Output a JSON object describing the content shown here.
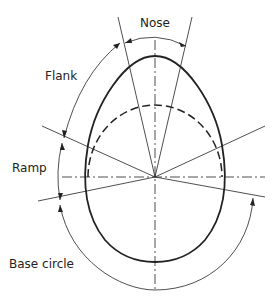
{
  "diagram": {
    "type": "cam-profile",
    "labels": {
      "nose": "Nose",
      "flank": "Flank",
      "ramp": "Ramp",
      "base_circle": "Base circle"
    },
    "colors": {
      "line": "#222222",
      "background": "#ffffff"
    }
  }
}
